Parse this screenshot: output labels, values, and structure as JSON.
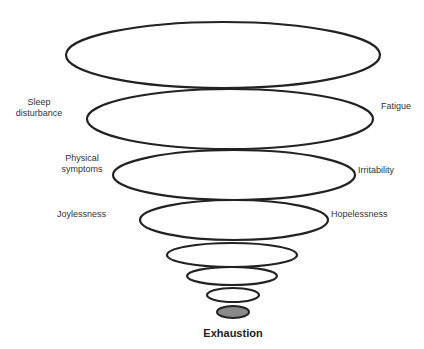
{
  "diagram": {
    "type": "funnel-of-ellipses",
    "labels_left": [
      {
        "line1": "Sleep",
        "line2": "disturbance"
      },
      {
        "line1": "Physical",
        "line2": "symptoms"
      },
      {
        "line1": "Joylessness",
        "line2": ""
      }
    ],
    "labels_right": [
      {
        "text": "Fatigue"
      },
      {
        "text": "Irritability"
      },
      {
        "text": "Hopelessness"
      }
    ],
    "end_label": "Exhaustion",
    "stroke_color": "#222222",
    "end_fill_color": "#8a8a8a",
    "ellipses": [
      {
        "cx": 223,
        "cy": 55,
        "rx": 157,
        "ry": 33
      },
      {
        "cx": 230,
        "cy": 119,
        "rx": 143,
        "ry": 30
      },
      {
        "cx": 234,
        "cy": 175,
        "rx": 121,
        "ry": 25
      },
      {
        "cx": 234,
        "cy": 220,
        "rx": 94,
        "ry": 20
      },
      {
        "cx": 232,
        "cy": 255,
        "rx": 65,
        "ry": 12
      },
      {
        "cx": 232,
        "cy": 276,
        "rx": 45,
        "ry": 9
      },
      {
        "cx": 233,
        "cy": 295,
        "rx": 26,
        "ry": 7
      },
      {
        "cx": 233,
        "cy": 312,
        "rx": 16,
        "ry": 6
      }
    ]
  }
}
